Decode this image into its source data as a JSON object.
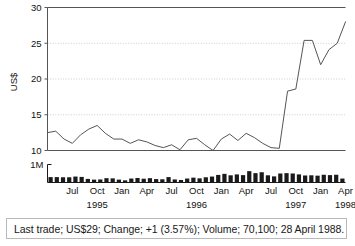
{
  "status": {
    "text": "Last trade; US$29; Change; +1 (3.57%); Volume; 70,100; 28 April 1988."
  },
  "axis": {
    "y_title": "US$",
    "volume_top_label": "1M"
  },
  "chart_data": {
    "type": "line",
    "title": "",
    "xlabel": "",
    "ylabel": "US$",
    "ylim": [
      10,
      30
    ],
    "yticks": [
      10,
      15,
      20,
      25,
      30
    ],
    "ytick_labels": [
      "10",
      "15",
      "20",
      "25",
      "30"
    ],
    "grid": true,
    "grid_lines_dotted": [
      15,
      20,
      25
    ],
    "legend": "none",
    "month_ticks": [
      "Jul",
      "Oct",
      "Jan",
      "Apr",
      "Jul",
      "Oct",
      "Jan",
      "Apr",
      "Jul",
      "Oct",
      "Jan",
      "Apr"
    ],
    "year_ticks": [
      "1995",
      "1996",
      "1997",
      "1998"
    ],
    "x": [
      "1995-04",
      "1995-05",
      "1995-06",
      "1995-07",
      "1995-08",
      "1995-09",
      "1995-10",
      "1995-11",
      "1995-12",
      "1996-01",
      "1996-02",
      "1996-03",
      "1996-04",
      "1996-05",
      "1996-06",
      "1996-07",
      "1996-08",
      "1996-09",
      "1996-10",
      "1996-11",
      "1996-12",
      "1997-01",
      "1997-02",
      "1997-03",
      "1997-04",
      "1997-05",
      "1997-06",
      "1997-07",
      "1997-08",
      "1997-09",
      "1997-10",
      "1997-11",
      "1997-12",
      "1998-01",
      "1998-02",
      "1998-03",
      "1998-04"
    ],
    "series": [
      {
        "name": "Price (US$)",
        "color": "#555555",
        "values": [
          12.5,
          12.7,
          11.6,
          11.0,
          12.2,
          13.0,
          13.5,
          12.4,
          11.6,
          11.6,
          11.0,
          11.5,
          11.2,
          10.7,
          10.4,
          10.8,
          10.1,
          11.5,
          11.7,
          10.8,
          10.0,
          11.6,
          12.3,
          11.4,
          12.4,
          11.8,
          11.0,
          10.4,
          10.3,
          18.3,
          18.6,
          25.4,
          25.4,
          22.0,
          24.1,
          25.0,
          28.0
        ]
      }
    ],
    "volume": {
      "name": "Volume",
      "color": "#1a1a1a",
      "ylabel": "1M",
      "ylim": [
        0,
        1000000
      ],
      "values": [
        0.3,
        0.3,
        0.29,
        0.29,
        0.33,
        0.31,
        0.2,
        0.16,
        0.17,
        0.24,
        0.23,
        0.16,
        0.12,
        0.22,
        0.25,
        0.21,
        0.24,
        0.19,
        0.18,
        0.3,
        0.17,
        0.14,
        0.22,
        0.27,
        0.23,
        0.29,
        0.33,
        0.42,
        0.48,
        0.4,
        0.45,
        0.41,
        0.63,
        0.52,
        0.57,
        0.4,
        0.34,
        0.5,
        0.52,
        0.5,
        0.45,
        0.39,
        0.4,
        0.38,
        0.43,
        0.41,
        0.43,
        0.22
      ]
    }
  }
}
